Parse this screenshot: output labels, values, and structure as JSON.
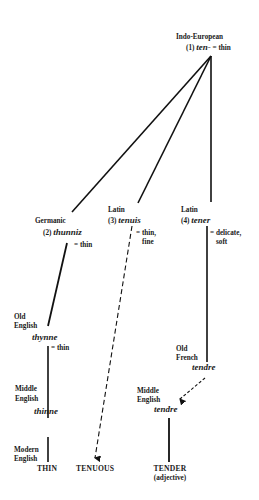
{
  "diagram": {
    "root": {
      "language": "Indo-European",
      "number": "(1)",
      "form": "ten-",
      "gloss": "= thin"
    },
    "branches": [
      {
        "language": "Germanic",
        "number": "(2)",
        "form": "thunniz",
        "gloss": "= thin"
      },
      {
        "language": "Latin",
        "number": "(3)",
        "form": "tenuis",
        "gloss_line1": "= thin,",
        "gloss_line2": "fine"
      },
      {
        "language": "Latin",
        "number": "(4)",
        "form": "tener",
        "gloss_line1": "= delicate,",
        "gloss_line2": "soft"
      }
    ],
    "english_chain": {
      "old_english": {
        "label_line1": "Old",
        "label_line2": "English",
        "form": "thynne",
        "gloss": "= thin"
      },
      "middle_english": {
        "label_line1": "Middle",
        "label_line2": "English",
        "form": "thinne"
      },
      "modern_english": {
        "label_line1": "Modern",
        "label_line2": "English",
        "word": "THIN"
      }
    },
    "tenuis_result": {
      "word": "TENUOUS"
    },
    "tener_chain": {
      "old_french": {
        "label_line1": "Old",
        "label_line2": "French",
        "form": "tendre"
      },
      "middle_english": {
        "label_line1": "Middle",
        "label_line2": "English",
        "form": "tendre"
      },
      "result": {
        "word": "TENDER",
        "note": "(adjective)"
      }
    }
  }
}
